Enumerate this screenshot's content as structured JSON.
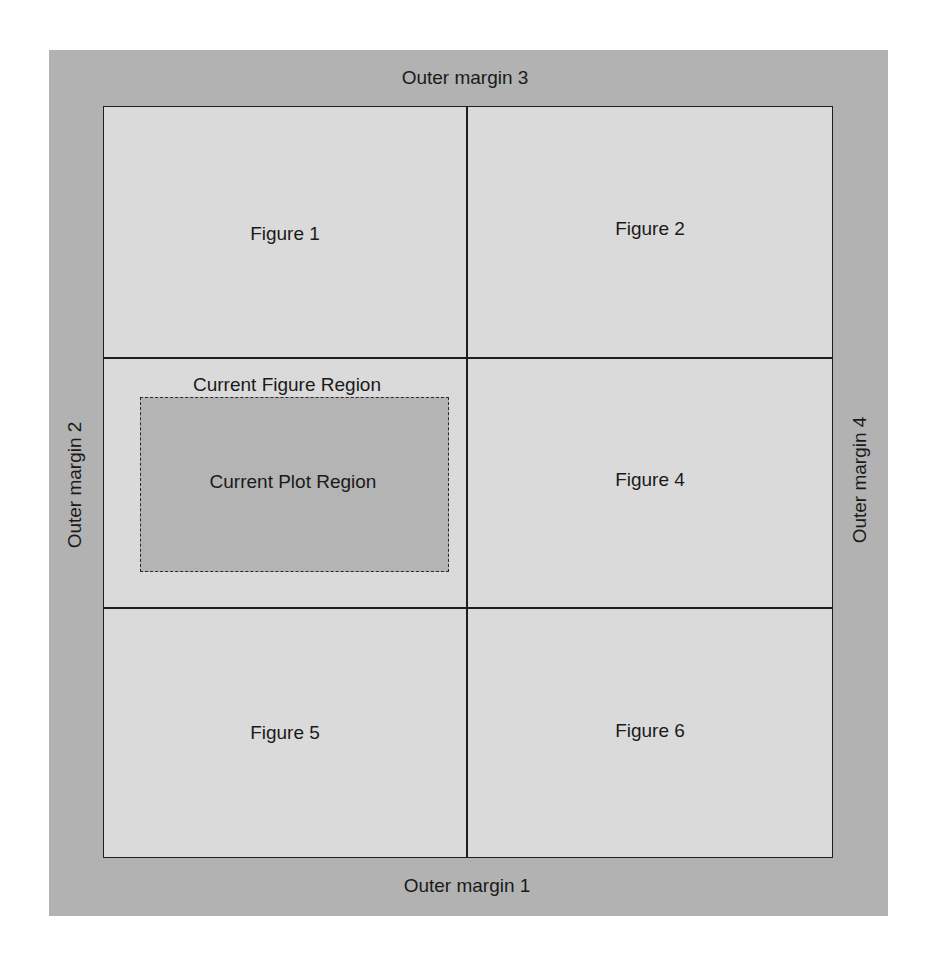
{
  "diagram": {
    "outer_margins": {
      "bottom": "Outer margin 1",
      "left": "Outer margin 2",
      "top": "Outer margin 3",
      "right": "Outer margin 4"
    },
    "figures": [
      {
        "label": "Figure 1"
      },
      {
        "label": "Figure 2"
      },
      {
        "label": "Current Figure Region",
        "plot_label": "Current Plot Region"
      },
      {
        "label": "Figure 4"
      },
      {
        "label": "Figure 5"
      },
      {
        "label": "Figure 6"
      }
    ],
    "colors": {
      "outer_margin": "#b2b2b2",
      "figure_region": "#dadada",
      "plot_region": "#b4b4b4",
      "lines": "#1e1e1e"
    }
  }
}
